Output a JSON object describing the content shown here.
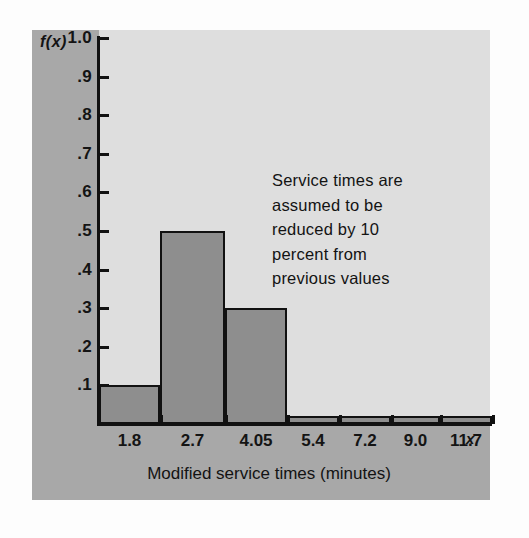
{
  "chart_data": {
    "type": "bar",
    "title": "",
    "subtitle": "",
    "xlabel": "Modified service times (minutes)",
    "ylabel": "f(x)",
    "x_variable_symbol": "x",
    "categories": [
      "1.8",
      "2.7",
      "4.05",
      "5.4",
      "7.2",
      "9.0",
      "11.7"
    ],
    "values": [
      0.1,
      0.5,
      0.3,
      0.02,
      0.02,
      0.02,
      0.02
    ],
    "bar_left_edges_px": [
      99,
      160,
      225,
      287,
      339,
      391,
      440
    ],
    "bar_widths_px": [
      61,
      65,
      62,
      52,
      52,
      49,
      52
    ],
    "ylim": [
      0,
      1.0
    ],
    "y_ticks": [
      "1.0",
      ".9",
      ".8",
      ".7",
      ".6",
      ".5",
      ".4",
      ".3",
      ".2",
      ".1"
    ],
    "y_tick_values": [
      1.0,
      0.9,
      0.8,
      0.7,
      0.6,
      0.5,
      0.4,
      0.3,
      0.2,
      0.1
    ],
    "x_tick_labels": [
      "1.8",
      "2.7",
      "4.05",
      "5.4",
      "7.2",
      "9.0",
      "11.7"
    ],
    "grid": false,
    "legend": "none",
    "annotations": [
      {
        "text": "Service times are\nassumed to be\nreduced by 10\npercent from\nprevious values",
        "x": 272,
        "y": 168
      }
    ],
    "colors": {
      "bar_fill": "#8e8e8e",
      "bar_stroke": "#111111",
      "plot_background": "#dedede",
      "panel_background": "#a8a8a8",
      "page_background": "#fdfdfd",
      "axis": "#111111",
      "text": "#131313"
    }
  },
  "figure": {
    "y_axis_title": "f(x)",
    "x_axis_title": "Modified service times (minutes)",
    "x_variable": "x",
    "annotation_text": "Service times are\nassumed to be\nreduced by 10\npercent from\nprevious values",
    "y_tick_labels": [
      "1.0",
      ".9",
      ".8",
      ".7",
      ".6",
      ".5",
      ".4",
      ".3",
      ".2",
      ".1"
    ],
    "x_tick_labels": [
      "1.8",
      "2.7",
      "4.05",
      "5.4",
      "7.2",
      "9.0",
      "11.7"
    ]
  }
}
